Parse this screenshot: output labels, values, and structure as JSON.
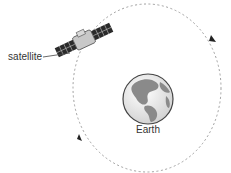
{
  "diagram": {
    "labels": {
      "satellite": "satellite",
      "earth": "Earth"
    },
    "colors": {
      "orbit": "#999999",
      "earth_land": "#8a8a8a",
      "earth_ocean": "#e6e6e6",
      "earth_outline": "#444444",
      "satellite_panel": "#2a2a2a",
      "satellite_body": "#c8c8c8",
      "text": "#333333"
    },
    "orbit": {
      "style": "dashed",
      "direction_arrows": 2
    }
  }
}
